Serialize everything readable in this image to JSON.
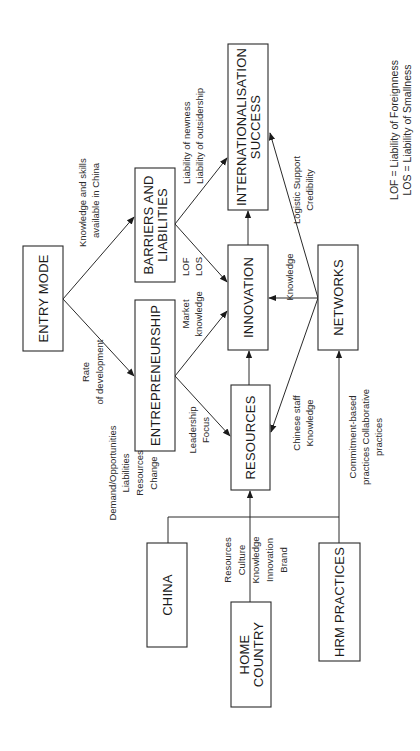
{
  "diagram": {
    "orientation": "rotated-90-ccw",
    "nodes": {
      "entry_mode": {
        "label": "ENTRY MODE"
      },
      "entrepreneurship": {
        "label": "ENTREPRENEURSHIP"
      },
      "barriers": {
        "line1": "BARRIERS AND",
        "line2": "LIABILITIES"
      },
      "innovation": {
        "label": "INNOVATION"
      },
      "internationalisation": {
        "line1": "INTERNATIONALISATION",
        "line2": "SUCCESS"
      },
      "resources": {
        "label": "RESOURCES"
      },
      "networks": {
        "label": "NETWORKS"
      },
      "china": {
        "label": "CHINA"
      },
      "home_country": {
        "line1": "HOME",
        "line2": "COUNTRY"
      },
      "hrm_practices": {
        "label": "HRM PRACTICES"
      }
    },
    "edges": {
      "entry_to_barriers": {
        "line1": "Knowledge and skills",
        "line2": "available in China"
      },
      "entry_to_entrepreneurship": {
        "line1": "Rate",
        "line2": "of development"
      },
      "barriers_to_internationalisation": {
        "line1": "Liability of newness",
        "line2": "Liability of outsidership"
      },
      "barriers_to_innovation": {
        "line1": "LOF",
        "line2": "LOS"
      },
      "entrepreneurship_to_innovation": {
        "line1": "Market",
        "line2": "knowledge"
      },
      "entrepreneurship_to_resources": {
        "line1": "Leadership",
        "line2": "Focus"
      },
      "networks_to_internationalisation": {
        "line1": "Logistic Support",
        "line2": "Credibility"
      },
      "networks_to_innovation": {
        "label": "Knowledge"
      },
      "networks_to_resources": {
        "line1": "Chinese staff",
        "line2": "Knowledge"
      },
      "china_to_resources": {
        "line1": "Demand/Opportunities",
        "line2": "Liabilities",
        "line3": "Resources",
        "line4": "Change"
      },
      "home_country_to_resources": {
        "line1": "Resources",
        "line2": "Culture",
        "line3": "Knowledge",
        "line4": "Innovation",
        "line5": "Brand"
      },
      "hrm_to_networks": {
        "line1": "Commitment-based",
        "line2": "practices Collaborative",
        "line3": "practices"
      }
    },
    "legend": {
      "lof": "LOF = Liability of Foreignness",
      "los": "LOS = Liability of Smallness"
    },
    "colors": {
      "stroke": "#2a2a2a",
      "text": "#1a1a1a",
      "background": "#ffffff"
    }
  }
}
